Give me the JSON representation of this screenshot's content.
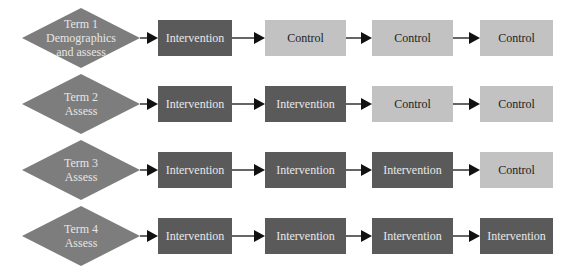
{
  "diagram": {
    "colors": {
      "diamond": "#7d7d7d",
      "intervention": "#5a5a5a",
      "control": "#c2c2c2",
      "arrow": "#111111"
    },
    "rows": [
      {
        "term": {
          "line1": "Term 1",
          "line2": "Demographics",
          "line3": "and assess"
        },
        "steps": [
          {
            "label": "Intervention",
            "type": "intervention"
          },
          {
            "label": "Control",
            "type": "control"
          },
          {
            "label": "Control",
            "type": "control"
          },
          {
            "label": "Control",
            "type": "control"
          }
        ]
      },
      {
        "term": {
          "line1": "Term 2",
          "line2": "Assess"
        },
        "steps": [
          {
            "label": "Intervention",
            "type": "intervention"
          },
          {
            "label": "Intervention",
            "type": "intervention"
          },
          {
            "label": "Control",
            "type": "control"
          },
          {
            "label": "Control",
            "type": "control"
          }
        ]
      },
      {
        "term": {
          "line1": "Term 3",
          "line2": "Assess"
        },
        "steps": [
          {
            "label": "Intervention",
            "type": "intervention"
          },
          {
            "label": "Intervention",
            "type": "intervention"
          },
          {
            "label": "Intervention",
            "type": "intervention"
          },
          {
            "label": "Control",
            "type": "control"
          }
        ]
      },
      {
        "term": {
          "line1": "Term 4",
          "line2": "Assess"
        },
        "steps": [
          {
            "label": "Intervention",
            "type": "intervention"
          },
          {
            "label": "Intervention",
            "type": "intervention"
          },
          {
            "label": "Intervention",
            "type": "intervention"
          },
          {
            "label": "Intervention",
            "type": "intervention"
          }
        ]
      }
    ]
  }
}
